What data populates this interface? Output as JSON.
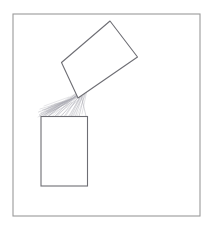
{
  "image": {
    "title": "Hand-drawn sketch of a tilted box pouring material into an upright box",
    "width": 213,
    "height": 228,
    "background_color": "#ffffff",
    "medium": "pencil line drawing on white paper"
  },
  "frame": {
    "name": "drawing-border",
    "description": "Thin rectangular pencil border enclosing the drawing",
    "x": 13,
    "y": 14,
    "width": 187,
    "height": 202,
    "stroke_color": "#9a9a9a",
    "stroke_width": 1.1,
    "fill": "none"
  },
  "shapes": {
    "tilted_box": {
      "name": "tilted-rectangle",
      "description": "Upper rectangle rotated clockwise, tipping its contents downward-left",
      "stroke_color": "#6e6e74",
      "stroke_width": 1.1,
      "fill": "#ffffff",
      "rotation_degrees": -27,
      "corners": {
        "top": [
          110,
          21
        ],
        "right": [
          137.5,
          57
        ],
        "bottom": [
          78,
          98
        ],
        "left": [
          61.5,
          62.5
        ]
      },
      "points": "110,21 137.5,57 78,98 61.5,62.5"
    },
    "upright_box": {
      "name": "upright-rectangle",
      "description": "Lower open-topped rectangle receiving the poured material",
      "stroke_color": "#6e6e74",
      "stroke_width": 1.1,
      "fill": "#ffffff",
      "x": 41,
      "y": 116.5,
      "width": 46.5,
      "height": 69.5,
      "corners": {
        "top_left": [
          41,
          116.5
        ],
        "top_right": [
          87.5,
          116.5
        ],
        "bottom_right": [
          87.5,
          186
        ],
        "bottom_left": [
          41,
          186
        ]
      }
    }
  },
  "pour": {
    "name": "pouring-hatching",
    "description": "Fan of fine diagonal pencil strokes representing material falling from the tilted box into the upright box",
    "stroke_color": "#a9a9b0",
    "stroke_width": 0.5,
    "origin": [
      80,
      94
    ],
    "spread_left": [
      38,
      118
    ],
    "spread_right": [
      86,
      116
    ],
    "strokes": [
      {
        "x1": 79.5,
        "y1": 93.0,
        "x2": 52.0,
        "y2": 116.5
      },
      {
        "x1": 80.5,
        "y1": 92.0,
        "x2": 47.0,
        "y2": 117.0
      },
      {
        "x1": 78.5,
        "y1": 94.5,
        "x2": 43.0,
        "y2": 117.5
      },
      {
        "x1": 77.5,
        "y1": 95.5,
        "x2": 39.5,
        "y2": 116.0
      },
      {
        "x1": 81.0,
        "y1": 91.0,
        "x2": 57.0,
        "y2": 116.5
      },
      {
        "x1": 76.5,
        "y1": 96.5,
        "x2": 41.0,
        "y2": 113.0
      },
      {
        "x1": 82.0,
        "y1": 90.5,
        "x2": 61.5,
        "y2": 116.0
      },
      {
        "x1": 75.5,
        "y1": 97.5,
        "x2": 44.5,
        "y2": 110.0
      },
      {
        "x1": 83.0,
        "y1": 89.5,
        "x2": 66.0,
        "y2": 115.5
      },
      {
        "x1": 74.0,
        "y1": 98.0,
        "x2": 48.0,
        "y2": 107.5
      },
      {
        "x1": 84.0,
        "y1": 88.5,
        "x2": 70.0,
        "y2": 116.0
      },
      {
        "x1": 72.5,
        "y1": 98.5,
        "x2": 51.0,
        "y2": 105.5
      },
      {
        "x1": 85.0,
        "y1": 87.5,
        "x2": 74.0,
        "y2": 115.5
      },
      {
        "x1": 71.0,
        "y1": 99.0,
        "x2": 54.5,
        "y2": 104.0
      },
      {
        "x1": 78.0,
        "y1": 93.5,
        "x2": 55.0,
        "y2": 116.0
      },
      {
        "x1": 76.0,
        "y1": 94.0,
        "x2": 49.5,
        "y2": 115.0
      },
      {
        "x1": 74.5,
        "y1": 95.0,
        "x2": 45.5,
        "y2": 114.0
      },
      {
        "x1": 81.5,
        "y1": 92.5,
        "x2": 64.0,
        "y2": 116.5
      },
      {
        "x1": 83.5,
        "y1": 92.0,
        "x2": 68.5,
        "y2": 116.5
      },
      {
        "x1": 85.5,
        "y1": 91.5,
        "x2": 72.5,
        "y2": 116.0
      },
      {
        "x1": 70.0,
        "y1": 100.0,
        "x2": 46.0,
        "y2": 111.5
      },
      {
        "x1": 68.5,
        "y1": 100.5,
        "x2": 42.5,
        "y2": 110.0
      },
      {
        "x1": 66.5,
        "y1": 101.0,
        "x2": 40.0,
        "y2": 109.0
      },
      {
        "x1": 73.0,
        "y1": 99.5,
        "x2": 50.0,
        "y2": 112.5
      },
      {
        "x1": 77.0,
        "y1": 97.0,
        "x2": 47.5,
        "y2": 112.0
      },
      {
        "x1": 79.0,
        "y1": 96.0,
        "x2": 53.5,
        "y2": 110.5
      },
      {
        "x1": 86.0,
        "y1": 93.0,
        "x2": 77.0,
        "y2": 116.0
      },
      {
        "x1": 84.5,
        "y1": 94.5,
        "x2": 79.0,
        "y2": 116.5
      },
      {
        "x1": 82.5,
        "y1": 96.0,
        "x2": 75.5,
        "y2": 116.0
      },
      {
        "x1": 80.0,
        "y1": 98.0,
        "x2": 71.0,
        "y2": 116.5
      },
      {
        "x1": 64.5,
        "y1": 102.0,
        "x2": 38.5,
        "y2": 112.0
      },
      {
        "x1": 62.5,
        "y1": 103.5,
        "x2": 39.5,
        "y2": 114.5
      },
      {
        "x1": 67.5,
        "y1": 103.0,
        "x2": 43.5,
        "y2": 115.0
      },
      {
        "x1": 71.5,
        "y1": 102.5,
        "x2": 48.5,
        "y2": 116.0
      },
      {
        "x1": 75.0,
        "y1": 101.0,
        "x2": 56.0,
        "y2": 115.5
      },
      {
        "x1": 78.5,
        "y1": 100.0,
        "x2": 60.5,
        "y2": 116.0
      },
      {
        "x1": 87.0,
        "y1": 90.0,
        "x2": 82.0,
        "y2": 114.0
      },
      {
        "x1": 60.5,
        "y1": 105.0,
        "x2": 41.5,
        "y2": 116.5
      },
      {
        "x1": 58.5,
        "y1": 107.0,
        "x2": 44.0,
        "y2": 116.0
      },
      {
        "x1": 69.0,
        "y1": 97.0,
        "x2": 44.0,
        "y2": 106.0
      }
    ],
    "edge_strokes": [
      {
        "x1": 78.0,
        "y1": 92.0,
        "x2": 38.0,
        "y2": 117.0
      },
      {
        "x1": 80.0,
        "y1": 90.5,
        "x2": 86.0,
        "y2": 116.0
      }
    ]
  },
  "labels": {
    "none_visible": ""
  }
}
